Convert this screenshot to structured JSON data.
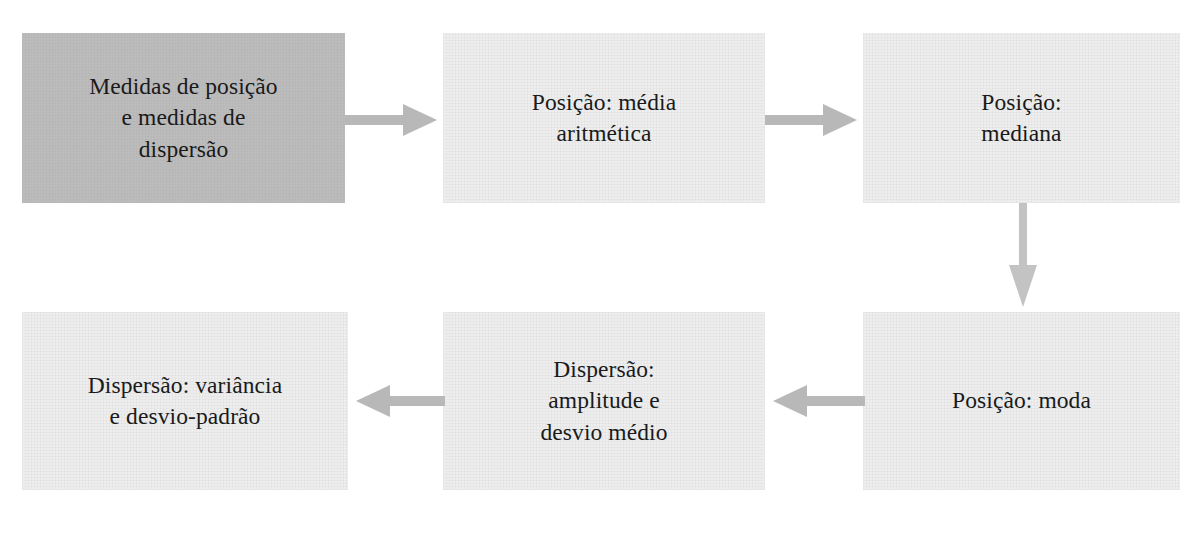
{
  "diagram": {
    "background_color": "#ffffff",
    "arrow_color": "#b8b8b8",
    "text_color": "#1a1a1a",
    "nodes": [
      {
        "id": "medidas-posicao-dispersao",
        "label": "Medidas de posição\ne medidas de\ndispersão",
        "fill": "#bcbcbc",
        "style": "shaded"
      },
      {
        "id": "posicao-media-aritmetica",
        "label": "Posição: média\naritmética",
        "fill": "#eeeeee",
        "style": "plain"
      },
      {
        "id": "posicao-mediana",
        "label": "Posição:\nmediana",
        "fill": "#eeeeee",
        "style": "plain"
      },
      {
        "id": "dispersao-variancia-desvio-padrao",
        "label": "Dispersão: variância\ne desvio-padrão",
        "fill": "#eeeeee",
        "style": "plain"
      },
      {
        "id": "dispersao-amplitude-desvio-medio",
        "label": "Dispersão:\namplitude e\ndesvio médio",
        "fill": "#eeeeee",
        "style": "plain"
      },
      {
        "id": "posicao-moda",
        "label": "Posição: moda",
        "fill": "#eeeeee",
        "style": "plain"
      }
    ],
    "arrows": [
      {
        "id": "arrow-1-to-2",
        "from": "medidas-posicao-dispersao",
        "to": "posicao-media-aritmetica",
        "direction": "right"
      },
      {
        "id": "arrow-2-to-3",
        "from": "posicao-media-aritmetica",
        "to": "posicao-mediana",
        "direction": "right"
      },
      {
        "id": "arrow-3-to-4",
        "from": "posicao-mediana",
        "to": "posicao-moda",
        "direction": "down"
      },
      {
        "id": "arrow-4-to-5",
        "from": "posicao-moda",
        "to": "dispersao-amplitude-desvio-medio",
        "direction": "left"
      },
      {
        "id": "arrow-5-to-6",
        "from": "dispersao-amplitude-desvio-medio",
        "to": "dispersao-variancia-desvio-padrao",
        "direction": "left"
      }
    ]
  }
}
